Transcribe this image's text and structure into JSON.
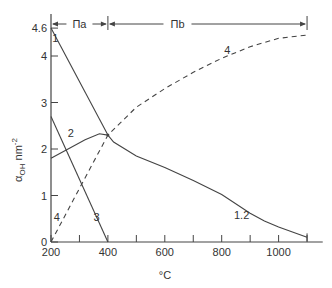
{
  "chart_data": {
    "type": "line",
    "title": "",
    "xlabel": "°C",
    "ylabel": "α_OH nm⁻²",
    "ylabel_main": "α",
    "ylabel_sub": "OH",
    "ylabel_unit": " nm",
    "ylabel_sup": "-2",
    "xlim": [
      200,
      1120
    ],
    "ylim": [
      0,
      4.6
    ],
    "x_ticks": [
      200,
      300,
      400,
      500,
      600,
      700,
      800,
      900,
      1000,
      1100
    ],
    "x_tick_labels": [
      "200",
      "400",
      "600",
      "800",
      "1000"
    ],
    "x_tick_label_values": [
      200,
      400,
      600,
      800,
      1000
    ],
    "y_ticks": [
      0,
      1,
      2,
      3,
      4,
      4.6
    ],
    "y_tick_labels": [
      "0",
      "1",
      "2",
      "3",
      "4",
      "4.6"
    ],
    "grid": false,
    "regions": [
      {
        "label": "Πa",
        "from": 200,
        "to": 400
      },
      {
        "label": "Πb",
        "from": 400,
        "to": 1100
      }
    ],
    "series": [
      {
        "name": "1",
        "style": "solid",
        "x": [
          200,
          400
        ],
        "y": [
          4.6,
          2.3
        ]
      },
      {
        "name": "2",
        "style": "solid",
        "x": [
          200,
          260,
          320,
          370,
          400
        ],
        "y": [
          1.8,
          2.0,
          2.2,
          2.33,
          2.3
        ]
      },
      {
        "name": "3",
        "style": "solid",
        "x": [
          200,
          400
        ],
        "y": [
          2.7,
          0.0
        ]
      },
      {
        "name": "4",
        "style": "dashed",
        "x": [
          200,
          300,
          400,
          500,
          600,
          700,
          800,
          900,
          1000,
          1100
        ],
        "y": [
          0.0,
          1.15,
          2.3,
          2.9,
          3.3,
          3.65,
          3.95,
          4.2,
          4.38,
          4.45
        ]
      },
      {
        "name": "1.2",
        "style": "solid",
        "x": [
          400,
          420,
          500,
          600,
          700,
          800,
          900,
          950,
          1000,
          1100
        ],
        "y": [
          2.3,
          2.15,
          1.85,
          1.6,
          1.32,
          1.02,
          0.62,
          0.45,
          0.32,
          0.1
        ]
      }
    ],
    "annotations": [
      {
        "text": "1",
        "x": 215,
        "y": 4.3
      },
      {
        "text": "2",
        "x": 270,
        "y": 2.25
      },
      {
        "text": "3",
        "x": 360,
        "y": 0.45
      },
      {
        "text": "4",
        "x": 220,
        "y": 0.45
      },
      {
        "text": "4",
        "x": 820,
        "y": 4.05
      },
      {
        "text": "1.2",
        "x": 870,
        "y": 0.5
      }
    ]
  }
}
